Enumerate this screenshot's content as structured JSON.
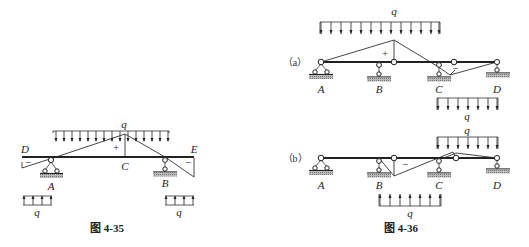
{
  "figure_35": {
    "caption": "图 4-35",
    "labels": {
      "D": "D",
      "E": "E",
      "A": "A",
      "B": "B",
      "C": "C"
    },
    "signs": {
      "plus": "+",
      "minus_left": "−",
      "minus_right": "−"
    },
    "loads": {
      "top": "q",
      "bottom_left": "q",
      "bottom_right": "q"
    }
  },
  "figure_36": {
    "caption": "图 4-36",
    "a": {
      "tag": "（a）",
      "labels": {
        "A": "A",
        "B": "B",
        "C": "C",
        "D": "D"
      },
      "signs": {
        "plus": "+",
        "minus": "−"
      },
      "loads": {
        "top": "q",
        "bottom": "q"
      }
    },
    "b": {
      "tag": "（b）",
      "labels": {
        "A": "A",
        "B": "B",
        "C": "C",
        "D": "D"
      },
      "signs": {
        "minus": "−"
      },
      "loads": {
        "top": "q",
        "bottom": "q"
      }
    }
  }
}
